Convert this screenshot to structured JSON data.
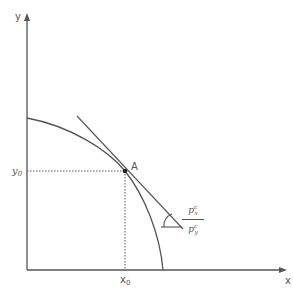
{
  "diagram": {
    "type": "production possibility frontier with tangent price line",
    "axes": {
      "x_label": "x",
      "y_label": "y"
    },
    "point": {
      "label": "A",
      "x_label": "x",
      "x_sub": "0",
      "y_label": "y",
      "y_sub": "0"
    },
    "slope_label": {
      "numerator": "p",
      "numerator_sup": "c",
      "numerator_sub": "x",
      "denominator": "p",
      "denominator_sup": "c",
      "denominator_sub": "y"
    },
    "colors": {
      "line": "#555555",
      "point": "#222222",
      "background": "#ffffff"
    }
  }
}
